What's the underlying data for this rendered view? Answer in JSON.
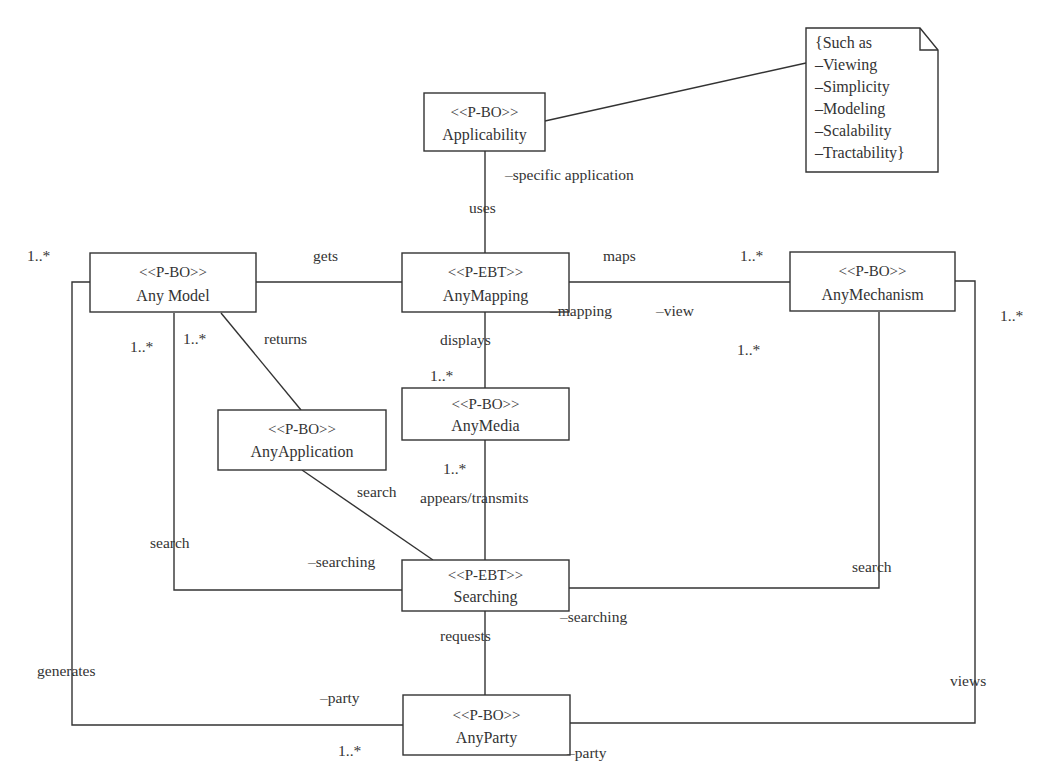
{
  "classes": {
    "applicability": {
      "stereotype": "<<P-BO>>",
      "name": "Applicability"
    },
    "any_model": {
      "stereotype": "<<P-BO>>",
      "name": "Any Model"
    },
    "any_mapping": {
      "stereotype": "<<P-EBT>>",
      "name": "AnyMapping"
    },
    "any_mechanism": {
      "stereotype": "<<P-BO>>",
      "name": "AnyMechanism"
    },
    "any_media": {
      "stereotype": "<<P-BO>>",
      "name": "AnyMedia"
    },
    "any_application": {
      "stereotype": "<<P-BO>>",
      "name": "AnyApplication"
    },
    "searching": {
      "stereotype": "<<P-EBT>>",
      "name": "Searching"
    },
    "any_party": {
      "stereotype": "<<P-BO>>",
      "name": "AnyParty"
    }
  },
  "note": {
    "lines": [
      "{Such as",
      "–Viewing",
      "–Simplicity",
      "–Modeling",
      "–Scalability",
      "–Tractability}"
    ]
  },
  "labels": {
    "specific_application": "–specific application",
    "uses": "uses",
    "gets": "gets",
    "maps": "maps",
    "mapping_role": "–mapping",
    "view_role": "–view",
    "displays": "displays",
    "returns": "returns",
    "search_app": "search",
    "appears_transmits": "appears/transmits",
    "search_model": "search",
    "searching_role_left": "–searching",
    "search_mechanism": "search",
    "searching_role_right": "–searching",
    "requests": "requests",
    "generates": "generates",
    "party_role_left": "–party",
    "views": "views",
    "party_role_bottom": "–party"
  },
  "multiplicities": {
    "model_outer_left": "1..*",
    "model_below_left": "1..*",
    "model_below_right": "1..*",
    "mechanism_top": "1..*",
    "mechanism_right": "1..*",
    "mechanism_below": "1..*",
    "media_top": "1..*",
    "media_bottom": "1..*",
    "party_bottom": "1..*"
  }
}
